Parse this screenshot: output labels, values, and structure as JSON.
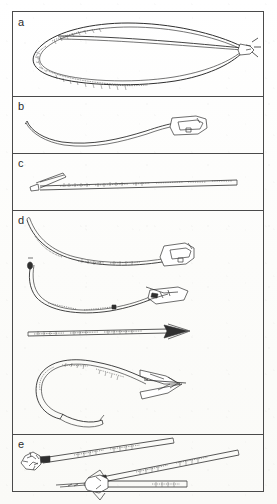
{
  "figure": {
    "kind": "line-drawing-plate",
    "panel_count": 5,
    "background_color": "#fdfdfb",
    "ink_color": "#2f2f2f",
    "frame_color": "#4a4a4a"
  },
  "panels": [
    {
      "label": "a",
      "caption_text": "a",
      "artifact_kind": "bow-with-bowstring",
      "object_count": 1,
      "has_inscription": true,
      "inscription_text": "",
      "objects": [
        {
          "name": "bow-stave-with-string",
          "description": "long elongated loop: bow stave curving left, bowstring running back to nocked tip at right",
          "orientation": "horizontal",
          "terminal": "string-nock-loop-right"
        }
      ]
    },
    {
      "label": "b",
      "caption_text": "b",
      "artifact_kind": "curved-shaft-with-nock-fitting",
      "object_count": 1,
      "has_inscription": false,
      "inscription_text": "",
      "objects": [
        {
          "name": "curved-shaft",
          "description": "slender S-curved shaft tapering to the left, socketed block fitting at right end",
          "orientation": "horizontal",
          "terminal": "socket-block-right"
        }
      ]
    },
    {
      "label": "c",
      "caption_text": "c",
      "artifact_kind": "inscribed-arrow-shaft",
      "object_count": 1,
      "has_inscription": true,
      "inscription_text": "RETURN TO P.O. BOX",
      "objects": [
        {
          "name": "inscribed-arrow",
          "description": "straight shaft with lettered inscription along its length, flat blade point at left",
          "orientation": "horizontal",
          "terminal": "blade-point-left"
        }
      ]
    },
    {
      "label": "d",
      "caption_text": "d",
      "artifact_kind": "hafted-and-barbed-points",
      "object_count": 4,
      "has_inscription": true,
      "inscription_text": "",
      "objects": [
        {
          "name": "curved-shaft-with-socketed-head",
          "description": "gently curved inscribed shaft, open socketed head fitting at right",
          "orientation": "horizontal",
          "terminal": "socketed-head-right"
        },
        {
          "name": "hooked-shaft-with-winged-head",
          "description": "shaft with knobbed hook at left end, flat winged head mounted at right",
          "orientation": "horizontal",
          "terminal": "winged-head-right"
        },
        {
          "name": "straight-inscribed-arrow",
          "description": "straight inscribed shaft with solid triangular arrowhead at right",
          "orientation": "horizontal",
          "terminal": "triangular-point-right"
        },
        {
          "name": "hooked-shaft-with-barbed-point",
          "description": "strongly recurved hook-shaped inscribed shaft with large barbed point at right",
          "orientation": "horizontal",
          "terminal": "barbed-point-right"
        }
      ]
    },
    {
      "label": "e",
      "caption_text": "e",
      "artifact_kind": "blunt-and-feathered-darts",
      "object_count": 3,
      "has_inscription": true,
      "inscription_text": "",
      "objects": [
        {
          "name": "blunt-headed-dart-upper",
          "description": "inscribed tapering shaft angled down-left ending in irregular knobbed blunt head",
          "orientation": "diagonal",
          "terminal": "blunt-knob-left"
        },
        {
          "name": "blunt-headed-dart-middle",
          "description": "inscribed tapering shaft angled down-left meeting the lower head assembly",
          "orientation": "diagonal",
          "terminal": "blunt-knob-left"
        },
        {
          "name": "feathered-dart-lower",
          "description": "horizontal shaft with splayed feather-barb head and fine tip projecting left",
          "orientation": "horizontal",
          "terminal": "feathered-tip-left"
        }
      ]
    }
  ]
}
